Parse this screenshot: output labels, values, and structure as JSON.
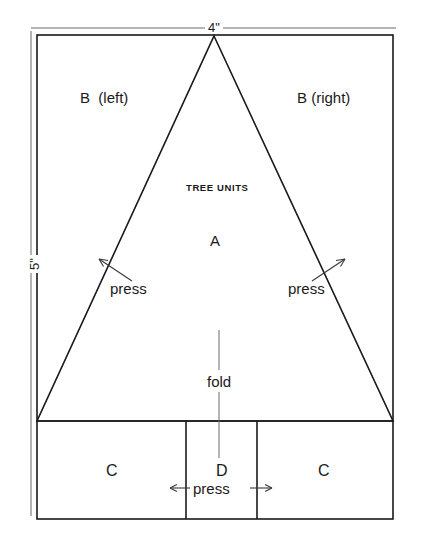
{
  "diagram": {
    "title": "TREE UNITS",
    "dimensions": {
      "width_label": "4\"",
      "height_label": "5\""
    },
    "regions": {
      "triangle_label": "A",
      "top_left_label": "B  (left)",
      "top_right_label": "B (right)",
      "bottom_left_label": "C",
      "bottom_center_label": "D",
      "bottom_right_label": "C"
    },
    "annotations": {
      "press_left": "press",
      "press_right": "press",
      "press_bottom": "press",
      "fold": "fold"
    },
    "colors": {
      "line": "#1a1a1a",
      "thin_line": "#555555",
      "background": "#ffffff"
    }
  }
}
